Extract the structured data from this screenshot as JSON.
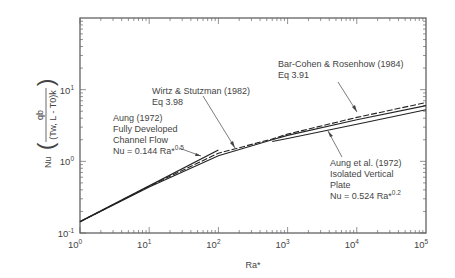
{
  "chart_data": {
    "type": "line",
    "title": "",
    "xlabel": "Ra*",
    "ylabel": "Nu",
    "ylabel_expression": {
      "numerator": "qb",
      "denominator": "(Tw, L - T0)k"
    },
    "xscale": "log",
    "yscale": "log",
    "xlim": [
      1,
      100000
    ],
    "ylim": [
      0.1,
      100
    ],
    "x_ticks": [
      {
        "base": "10",
        "exp": "0"
      },
      {
        "base": "10",
        "exp": "1"
      },
      {
        "base": "10",
        "exp": "2"
      },
      {
        "base": "10",
        "exp": "3"
      },
      {
        "base": "10",
        "exp": "4"
      },
      {
        "base": "10",
        "exp": "5"
      }
    ],
    "y_ticks": [
      {
        "base": "10",
        "exp": "-1"
      },
      {
        "base": "10",
        "exp": "0"
      },
      {
        "base": "10",
        "exp": "1"
      }
    ],
    "grid": false,
    "series": [
      {
        "name": "Aung (1972) Fully Developed Channel Flow",
        "equation": "Nu = 0.144 Ra*^0.5",
        "x": [
          1,
          100
        ],
        "y": [
          0.144,
          1.44
        ]
      },
      {
        "name": "Wirtz & Stutzman (1982) Eq 3.98",
        "x": [
          1,
          10,
          100,
          600,
          1000,
          10000,
          100000
        ],
        "y": [
          0.144,
          0.44,
          1.2,
          2.0,
          2.3,
          3.8,
          6.0
        ]
      },
      {
        "name": "Bar-Cohen & Rosenhow (1984) Eq 3.91",
        "x": [
          1,
          10,
          100,
          600,
          1000,
          10000,
          100000
        ],
        "y": [
          0.144,
          0.45,
          1.3,
          2.05,
          2.4,
          4.1,
          6.6
        ]
      },
      {
        "name": "Aung et al. (1972) Isolated Vertical Plate",
        "equation": "Nu = 0.524 Ra*^0.2",
        "x": [
          600,
          1000,
          10000,
          100000
        ],
        "y": [
          1.89,
          2.08,
          3.3,
          5.24
        ]
      }
    ],
    "annotations": [
      {
        "lines": [
          "Bar-Cohen & Rosenhow (1984)",
          "Eq 3.91"
        ]
      },
      {
        "lines": [
          "Wirtz & Stutzman (1982)",
          "Eq 3.98"
        ]
      },
      {
        "lines": [
          "Aung (1972)",
          "Fully Developed",
          "Channel Flow",
          "Nu = 0.144 Ra*"
        ],
        "exp": "0.5"
      },
      {
        "lines": [
          "Aung et al. (1972)",
          "Isolated Vertical",
          "Plate",
          "Nu = 0.524 Ra*"
        ],
        "exp": "0.2"
      }
    ]
  }
}
